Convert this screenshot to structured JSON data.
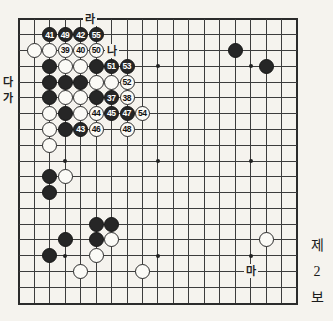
{
  "colors": {
    "paper": "#f5f3ee",
    "grid_line": "#3c3c3c",
    "black_stone": "#262626",
    "white_stone": "#fbfaf6",
    "number_on_black": "#ffffff",
    "number_on_white": "#111111"
  },
  "board": {
    "size": 19,
    "star_points": [
      [
        3,
        3
      ],
      [
        9,
        3
      ],
      [
        15,
        3
      ],
      [
        3,
        9
      ],
      [
        9,
        9
      ],
      [
        15,
        9
      ],
      [
        3,
        15
      ],
      [
        9,
        15
      ],
      [
        15,
        15
      ]
    ],
    "stones": [
      {
        "c": 2,
        "r": 1,
        "color": "black",
        "n": "41"
      },
      {
        "c": 3,
        "r": 1,
        "color": "black",
        "n": "49"
      },
      {
        "c": 4,
        "r": 1,
        "color": "black",
        "n": "42"
      },
      {
        "c": 5,
        "r": 1,
        "color": "black",
        "n": "55"
      },
      {
        "c": 1,
        "r": 2,
        "color": "white",
        "n": ""
      },
      {
        "c": 2,
        "r": 2,
        "color": "white",
        "n": ""
      },
      {
        "c": 3,
        "r": 2,
        "color": "white",
        "n": "39"
      },
      {
        "c": 4,
        "r": 2,
        "color": "white",
        "n": "40"
      },
      {
        "c": 5,
        "r": 2,
        "color": "white",
        "n": "50"
      },
      {
        "c": 14,
        "r": 2,
        "color": "black",
        "n": ""
      },
      {
        "c": 2,
        "r": 3,
        "color": "black",
        "n": ""
      },
      {
        "c": 3,
        "r": 3,
        "color": "white",
        "n": ""
      },
      {
        "c": 4,
        "r": 3,
        "color": "white",
        "n": ""
      },
      {
        "c": 5,
        "r": 3,
        "color": "black",
        "n": ""
      },
      {
        "c": 6,
        "r": 3,
        "color": "black",
        "n": "51"
      },
      {
        "c": 7,
        "r": 3,
        "color": "black",
        "n": "53"
      },
      {
        "c": 16,
        "r": 3,
        "color": "black",
        "n": ""
      },
      {
        "c": 2,
        "r": 4,
        "color": "black",
        "n": ""
      },
      {
        "c": 3,
        "r": 4,
        "color": "black",
        "n": ""
      },
      {
        "c": 4,
        "r": 4,
        "color": "black",
        "n": ""
      },
      {
        "c": 5,
        "r": 4,
        "color": "white",
        "n": ""
      },
      {
        "c": 6,
        "r": 4,
        "color": "white",
        "n": ""
      },
      {
        "c": 7,
        "r": 4,
        "color": "white",
        "n": "52"
      },
      {
        "c": 2,
        "r": 5,
        "color": "black",
        "n": ""
      },
      {
        "c": 3,
        "r": 5,
        "color": "white",
        "n": ""
      },
      {
        "c": 4,
        "r": 5,
        "color": "white",
        "n": ""
      },
      {
        "c": 5,
        "r": 5,
        "color": "black",
        "n": ""
      },
      {
        "c": 6,
        "r": 5,
        "color": "black",
        "n": "37"
      },
      {
        "c": 7,
        "r": 5,
        "color": "white",
        "n": "38"
      },
      {
        "c": 2,
        "r": 6,
        "color": "white",
        "n": ""
      },
      {
        "c": 3,
        "r": 6,
        "color": "black",
        "n": ""
      },
      {
        "c": 4,
        "r": 6,
        "color": "white",
        "n": ""
      },
      {
        "c": 5,
        "r": 6,
        "color": "white",
        "n": "44"
      },
      {
        "c": 6,
        "r": 6,
        "color": "black",
        "n": "45"
      },
      {
        "c": 7,
        "r": 6,
        "color": "black",
        "n": "47"
      },
      {
        "c": 8,
        "r": 6,
        "color": "white",
        "n": "54"
      },
      {
        "c": 2,
        "r": 7,
        "color": "white",
        "n": ""
      },
      {
        "c": 3,
        "r": 7,
        "color": "black",
        "n": ""
      },
      {
        "c": 4,
        "r": 7,
        "color": "black",
        "n": "43"
      },
      {
        "c": 5,
        "r": 7,
        "color": "white",
        "n": "46"
      },
      {
        "c": 7,
        "r": 7,
        "color": "white",
        "n": "48"
      },
      {
        "c": 2,
        "r": 8,
        "color": "white",
        "n": ""
      },
      {
        "c": 2,
        "r": 10,
        "color": "black",
        "n": ""
      },
      {
        "c": 3,
        "r": 10,
        "color": "white",
        "n": ""
      },
      {
        "c": 2,
        "r": 11,
        "color": "black",
        "n": ""
      },
      {
        "c": 5,
        "r": 13,
        "color": "black",
        "n": ""
      },
      {
        "c": 6,
        "r": 13,
        "color": "black",
        "n": ""
      },
      {
        "c": 3,
        "r": 14,
        "color": "black",
        "n": ""
      },
      {
        "c": 5,
        "r": 14,
        "color": "black",
        "n": ""
      },
      {
        "c": 6,
        "r": 14,
        "color": "white",
        "n": ""
      },
      {
        "c": 16,
        "r": 14,
        "color": "white",
        "n": ""
      },
      {
        "c": 2,
        "r": 15,
        "color": "black",
        "n": ""
      },
      {
        "c": 5,
        "r": 15,
        "color": "white",
        "n": ""
      },
      {
        "c": 4,
        "r": 16,
        "color": "white",
        "n": ""
      },
      {
        "c": 8,
        "r": 16,
        "color": "white",
        "n": ""
      }
    ],
    "point_labels": [
      {
        "c": 4.6,
        "r": 0,
        "text": "라",
        "name": "point-label-ra"
      },
      {
        "c": 6,
        "r": 2,
        "text": "나",
        "name": "point-label-na"
      },
      {
        "c": 15,
        "r": 16,
        "text": "마",
        "name": "point-label-ma"
      }
    ],
    "edge_labels": [
      {
        "r": 4,
        "text": "다",
        "name": "edge-label-da"
      },
      {
        "r": 5,
        "text": "가",
        "name": "edge-label-ga"
      }
    ]
  },
  "caption": {
    "lines": [
      "제",
      "2",
      "보"
    ]
  }
}
